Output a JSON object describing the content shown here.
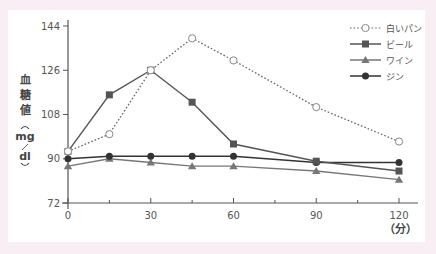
{
  "chart_data": {
    "type": "line",
    "title": "",
    "xlabel": "（分）",
    "ylabel": "血糖値（mg/dl）",
    "x": [
      0,
      15,
      30,
      45,
      60,
      90,
      120
    ],
    "xticks": [
      0,
      30,
      60,
      90,
      120
    ],
    "xminor_ticks": [
      15,
      45,
      75,
      105
    ],
    "yticks": [
      72,
      90,
      108,
      126,
      144
    ],
    "xlim": [
      0,
      120
    ],
    "ylim": [
      72,
      144
    ],
    "grid": false,
    "legend_position": "top-right",
    "series": [
      {
        "name": "白いパン",
        "style": "dotted",
        "marker": "open-circle",
        "color": "#666666",
        "values": [
          93,
          100,
          126,
          139,
          130,
          111,
          97
        ]
      },
      {
        "name": "ビール",
        "style": "solid",
        "marker": "square",
        "color": "#555555",
        "values": [
          93,
          116,
          126,
          113,
          96,
          89,
          85
        ]
      },
      {
        "name": "ワイン",
        "style": "solid",
        "marker": "triangle",
        "color": "#777777",
        "values": [
          87,
          90,
          88.5,
          87,
          87,
          85,
          81.5
        ]
      },
      {
        "name": "ジン",
        "style": "solid",
        "marker": "filled-circle",
        "color": "#333333",
        "values": [
          90,
          91,
          91,
          91,
          91,
          88.5,
          88.5
        ]
      }
    ]
  },
  "labels": {
    "y_title_chars": [
      "血",
      "糖",
      "値"
    ],
    "y_unit_top": "mg",
    "y_unit_bottom": "dl",
    "x_unit": "（分）"
  },
  "colors": {
    "background": "#f9eef3",
    "panel": "#ffffff",
    "axis": "#555555"
  }
}
